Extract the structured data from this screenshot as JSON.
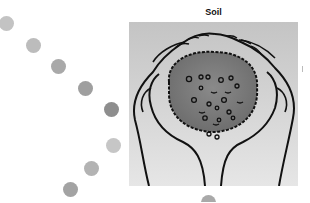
{
  "title": "Soil",
  "image": {
    "alt": "Illustration of two cupped hands holding a ball of soil",
    "subject": "soil-in-hands-icon"
  },
  "decorative_dots": [
    {
      "cx": 6,
      "cy": 23,
      "color": "#c3c3c3"
    },
    {
      "cx": 33,
      "cy": 45,
      "color": "#bcbcbc"
    },
    {
      "cx": 58,
      "cy": 66,
      "color": "#a9a9a9"
    },
    {
      "cx": 85,
      "cy": 88,
      "color": "#9f9f9f"
    },
    {
      "cx": 111,
      "cy": 109,
      "color": "#8e8e8e"
    },
    {
      "cx": 113,
      "cy": 145,
      "color": "#c6c6c6"
    },
    {
      "cx": 91,
      "cy": 168,
      "color": "#b3b3b3"
    },
    {
      "cx": 70,
      "cy": 189,
      "color": "#a3a3a3"
    },
    {
      "cx": 208,
      "cy": 202,
      "color": "#a9a9a9"
    }
  ]
}
